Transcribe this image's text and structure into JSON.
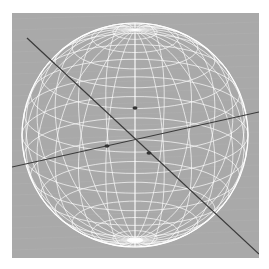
{
  "viewport": {
    "background_color": "#a9a9a9",
    "object": "wireframe-sphere",
    "wireframe_color": "#ffffff",
    "axis_color": "#3a3a3a",
    "sphere": {
      "cx": 123,
      "cy": 122,
      "rx": 113,
      "ry": 112,
      "latitudes": 16,
      "longitudes": 24
    },
    "axes": [
      {
        "name": "diagonal-axis",
        "x1": 15,
        "y1": 25,
        "x2": 247,
        "y2": 241
      },
      {
        "name": "horizontal-axis",
        "x1": 0,
        "y1": 154,
        "x2": 247,
        "y2": 99
      }
    ],
    "markers": [
      {
        "name": "pivot-handle-left",
        "x": 95,
        "y": 133
      },
      {
        "name": "pivot-handle-right",
        "x": 137,
        "y": 140
      },
      {
        "name": "pivot-handle-top",
        "x": 123,
        "y": 95
      }
    ]
  }
}
